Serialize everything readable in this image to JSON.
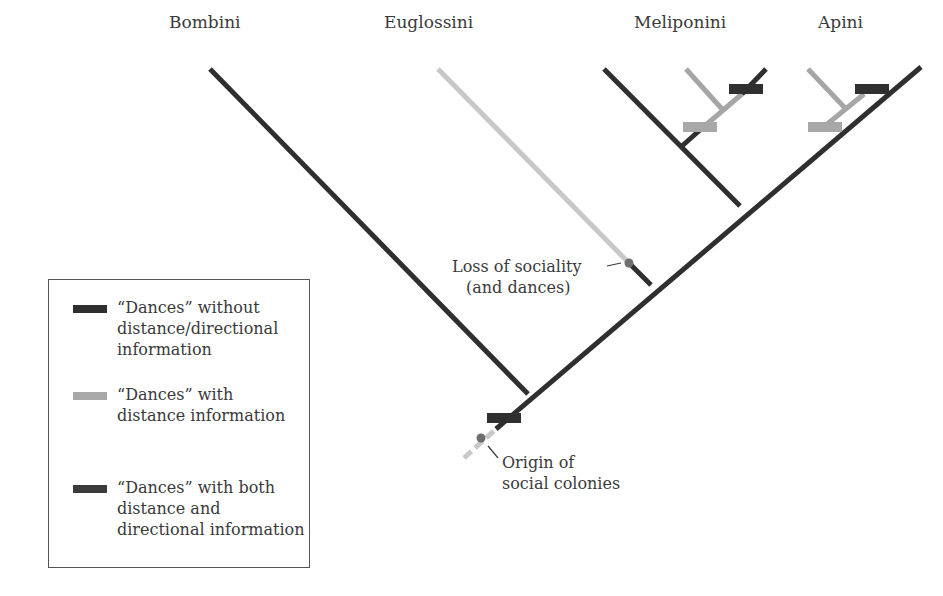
{
  "taxa": {
    "bombini": "Bombini",
    "euglossini": "Euglossini",
    "meliponini": "Meliponini",
    "apini": "Apini"
  },
  "annotations": {
    "loss_of_sociality_line1": "Loss of sociality",
    "loss_of_sociality_line2": "(and dances)",
    "origin_line1": "Origin of",
    "origin_line2": "social colonies"
  },
  "legend": {
    "items": [
      {
        "line1": "“Dances” without",
        "line2": "distance/directional",
        "line3": "information",
        "color": "#2f2f2f"
      },
      {
        "line1": "“Dances” with",
        "line2": "distance information",
        "color": "#a8a8a8"
      },
      {
        "line1": "“Dances” with both",
        "line2": "distance and",
        "line3": "directional information",
        "color": "#3b3b3b"
      }
    ]
  },
  "colors": {
    "dark_branch": "#2f2f2f",
    "light_branch": "#c8c8c8",
    "medium_branch": "#a6a6a6",
    "dot": "#6e6e6e"
  }
}
